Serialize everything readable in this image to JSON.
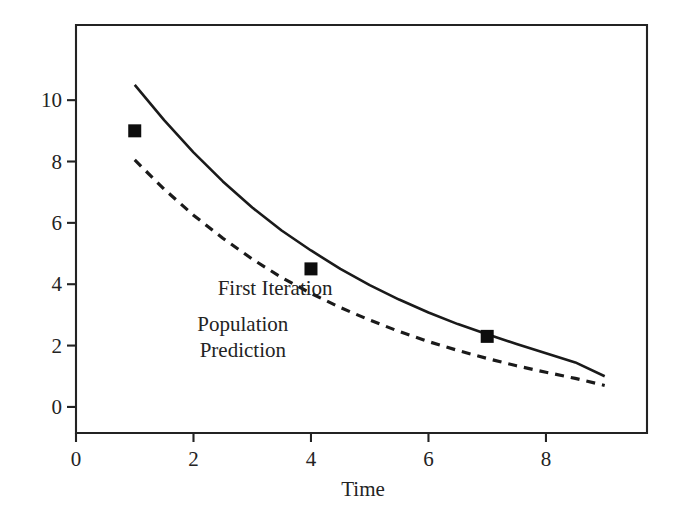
{
  "chart_data": {
    "type": "line",
    "title": "",
    "subtitle": "",
    "xlabel": "Time",
    "ylabel": "",
    "xlim": [
      0,
      9.72
    ],
    "ylim": [
      -0.85,
      12.45
    ],
    "grid": false,
    "legend_position": "inline-annotations",
    "background": "#ffffff",
    "foreground": "#232323",
    "xticks": [
      0,
      2,
      4,
      6,
      8
    ],
    "xtick_labels": [
      "0",
      "2",
      "4",
      "6",
      "8"
    ],
    "yticks": [
      0,
      2,
      4,
      6,
      8,
      10
    ],
    "ytick_labels": [
      "0",
      "2",
      "4",
      "6",
      "8",
      "10"
    ],
    "series": [
      {
        "name": "First Iteration",
        "style": "solid",
        "color": "#1a1a1a",
        "linewidth": 2.6,
        "annotation": "First Iteration",
        "annotation_lines": [
          "First Iteration"
        ],
        "annotation_x": 3.39,
        "annotation_y": 3.87,
        "x": [
          1.0,
          1.5,
          2.0,
          2.5,
          3.0,
          3.5,
          4.0,
          4.5,
          5.0,
          5.5,
          6.0,
          6.5,
          7.0,
          7.5,
          8.0,
          8.5,
          9.0
        ],
        "y": [
          10.5,
          9.35,
          8.3,
          7.35,
          6.5,
          5.75,
          5.1,
          4.5,
          3.97,
          3.5,
          3.08,
          2.7,
          2.37,
          2.05,
          1.75,
          1.45,
          1.0
        ]
      },
      {
        "name": "Population Prediction",
        "style": "dashed",
        "color": "#1a1a1a",
        "linewidth": 3.2,
        "dash_pattern": "9 7",
        "annotation": "Population Prediction",
        "annotation_lines": [
          "Population",
          "Prediction"
        ],
        "annotation_x": 2.84,
        "annotation_y": 2.26,
        "x": [
          1.0,
          1.5,
          2.0,
          2.5,
          3.0,
          3.5,
          4.0,
          4.5,
          5.0,
          5.5,
          6.0,
          6.5,
          7.0,
          7.5,
          8.0,
          8.5,
          9.0
        ],
        "y": [
          8.05,
          7.1,
          6.25,
          5.5,
          4.82,
          4.22,
          3.7,
          3.24,
          2.83,
          2.46,
          2.13,
          1.84,
          1.58,
          1.34,
          1.13,
          0.93,
          0.7
        ]
      }
    ],
    "points": {
      "name": "Observed data",
      "marker": "square",
      "color": "#0d0d0d",
      "size": 13,
      "x": [
        1,
        4,
        7
      ],
      "y": [
        9.0,
        4.5,
        2.3
      ]
    }
  },
  "annotations": {
    "first_iteration": "First Iteration",
    "population_line1": "Population",
    "population_line2": "Prediction",
    "time_label": "Time"
  }
}
